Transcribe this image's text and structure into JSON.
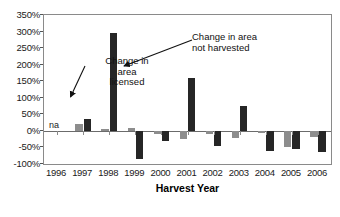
{
  "chart_data": {
    "type": "bar",
    "title": "",
    "xlabel": "Harvest Year",
    "ylabel": "",
    "categories": [
      "1996",
      "1997",
      "1998",
      "1999",
      "2000",
      "2001",
      "2002",
      "2003",
      "2004",
      "2005",
      "2006"
    ],
    "ylim": [
      -100,
      350
    ],
    "ytick_labels": [
      "350%",
      "300%",
      "250%",
      "200%",
      "150%",
      "100%",
      "50%",
      "0%",
      "-50%",
      "-100%"
    ],
    "ytick_values": [
      350,
      300,
      250,
      200,
      150,
      100,
      50,
      0,
      -50,
      -100
    ],
    "ytick_step": 50,
    "grid": false,
    "legend": "none",
    "value_unit": "percent",
    "series": [
      {
        "name": "Change in area licensed",
        "color": "#8d8d8d",
        "values": [
          null,
          20,
          5,
          8,
          -8,
          -25,
          -8,
          -22,
          -5,
          -50,
          -18
        ]
      },
      {
        "name": "Change in area not harvested",
        "color": "#262626",
        "values": [
          null,
          35,
          295,
          -85,
          -30,
          160,
          -45,
          75,
          -60,
          -55,
          -65
        ]
      }
    ],
    "missing_marker": {
      "text": "na",
      "category": "1996"
    },
    "annotations": [
      {
        "id": "licensed",
        "text": "Change in\narea\nlicensed",
        "points_to": "1997 licensed bar"
      },
      {
        "id": "not-harvested",
        "text": "Change in area\nnot harvested",
        "points_to": "1998 not-harvested bar"
      }
    ]
  }
}
